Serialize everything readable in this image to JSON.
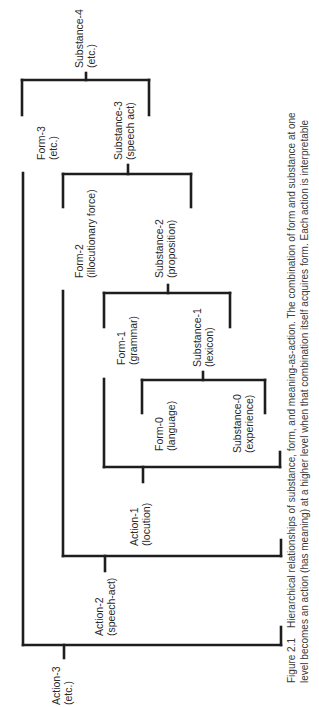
{
  "figure": {
    "orientation": "rotated -90deg (page turned sideways)",
    "caption": {
      "figure_number": "Figure 2.1",
      "line1": "Hierarchical relationships of substance, form, and meaning-as-action. The combination of form and substance at one",
      "line2": "level becomes an action (has meaning) at a higher level when that combination itself acquires form. Each action is interpretable"
    },
    "style": {
      "line_color": "#1e1e1e",
      "line_width": 2.6,
      "text_color": "#2a2a2a"
    },
    "nodes": [
      {
        "id": "substance-4",
        "line1": "Substance-4",
        "line2": "(etc.)",
        "x": 73,
        "y": 68
      },
      {
        "id": "form-3",
        "line1": "Form-3",
        "line2": "(etc.)",
        "x": 35,
        "y": 160
      },
      {
        "id": "substance-3",
        "line1": "Substance-3",
        "line2": "(speech act)",
        "x": 112,
        "y": 160
      },
      {
        "id": "form-2",
        "line1": "Form-2",
        "line2": "(illocutionary force)",
        "x": 73,
        "y": 278
      },
      {
        "id": "substance-2",
        "line1": "Substance-2",
        "line2": "(proposition)",
        "x": 153,
        "y": 278
      },
      {
        "id": "form-1",
        "line1": "Form-1",
        "line2": "(grammar)",
        "x": 115,
        "y": 365
      },
      {
        "id": "substance-1",
        "line1": "Substance-1",
        "line2": "(lexicon)",
        "x": 191,
        "y": 367
      },
      {
        "id": "form-0",
        "line1": "Form-0",
        "line2": "(language)",
        "x": 153,
        "y": 451
      },
      {
        "id": "substance-0",
        "line1": "Substance-0",
        "line2": "(experience)",
        "x": 231,
        "y": 453
      },
      {
        "id": "action-1",
        "line1": "Action-1",
        "line2": "(locution)",
        "x": 128,
        "y": 546
      },
      {
        "id": "action-2",
        "line1": "Action-2",
        "line2": "(speech-act)",
        "x": 93,
        "y": 636
      },
      {
        "id": "action-3",
        "line1": "Action-3",
        "line2": "(etc.)",
        "x": 50,
        "y": 705
      }
    ],
    "brackets": [
      {
        "id": "bracket-substance-4",
        "segments": [
          [
            22,
            80,
            149,
            80
          ],
          [
            22,
            80,
            22,
            115
          ],
          [
            149,
            80,
            149,
            115
          ],
          [
            86,
            73,
            86,
            80
          ]
        ]
      },
      {
        "id": "bracket-substance-3",
        "segments": [
          [
            63,
            174,
            191,
            174
          ],
          [
            63,
            174,
            63,
            207
          ],
          [
            191,
            174,
            191,
            207
          ],
          [
            128,
            165,
            128,
            174
          ]
        ]
      },
      {
        "id": "bracket-substance-2",
        "segments": [
          [
            104,
            293,
            230,
            293
          ],
          [
            104,
            293,
            104,
            327
          ],
          [
            230,
            293,
            230,
            327
          ],
          [
            168,
            285,
            168,
            293
          ]
        ]
      },
      {
        "id": "bracket-substance-1",
        "segments": [
          [
            142,
            380,
            265,
            380
          ],
          [
            142,
            380,
            142,
            413
          ],
          [
            265,
            380,
            265,
            413
          ],
          [
            203,
            372,
            203,
            380
          ]
        ]
      },
      {
        "id": "bracket-action-1",
        "segments": [
          [
            104,
            379,
            104,
            467
          ],
          [
            104,
            467,
            280,
            467
          ],
          [
            280,
            452,
            280,
            467
          ],
          [
            143,
            467,
            143,
            482
          ]
        ]
      },
      {
        "id": "bracket-action-2",
        "segments": [
          [
            63,
            291,
            63,
            556
          ],
          [
            63,
            556,
            281,
            556
          ],
          [
            281,
            540,
            281,
            556
          ],
          [
            105,
            556,
            105,
            571
          ]
        ]
      },
      {
        "id": "bracket-action-3",
        "segments": [
          [
            23,
            173,
            23,
            645
          ],
          [
            23,
            645,
            281,
            645
          ],
          [
            281,
            627,
            281,
            645
          ],
          [
            64,
            645,
            64,
            658
          ]
        ]
      }
    ]
  }
}
